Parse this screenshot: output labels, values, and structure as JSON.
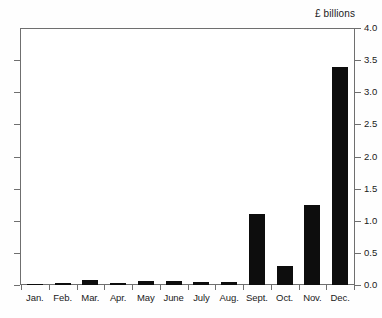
{
  "chart_data": {
    "type": "bar",
    "title": "",
    "unit_caption": "£ billions",
    "xlabel": "",
    "ylabel": "",
    "ylim": [
      0.0,
      4.0
    ],
    "ytick_step": 0.5,
    "grid": false,
    "legend": "none",
    "bar_color": "#0d0d0d",
    "axis_color": "#6f6f6f",
    "categories": [
      "Jan.",
      "Feb.",
      "Mar.",
      "Apr.",
      "May",
      "June",
      "July",
      "Aug.",
      "Sept.",
      "Oct.",
      "Nov.",
      "Dec."
    ],
    "values": [
      0.02,
      0.03,
      0.08,
      0.03,
      0.06,
      0.06,
      0.04,
      0.04,
      1.1,
      0.3,
      1.25,
      3.4
    ],
    "ytick_labels": [
      "4.0",
      "3.5",
      "3.0",
      "2.5",
      "2.0",
      "1.5",
      "1.0",
      "0.5",
      "0.0"
    ],
    "ytick_values": [
      4.0,
      3.5,
      3.0,
      2.5,
      2.0,
      1.5,
      1.0,
      0.5,
      0.0
    ]
  }
}
